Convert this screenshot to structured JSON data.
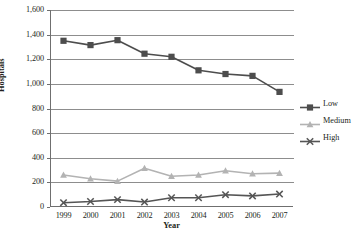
{
  "chart_data": {
    "type": "line",
    "title": "",
    "xlabel": "Year",
    "ylabel": "Hospitals",
    "categories": [
      "1999",
      "2000",
      "2001",
      "2002",
      "2003",
      "2004",
      "2005",
      "2006",
      "2007"
    ],
    "ylim": [
      0,
      1600
    ],
    "ytick_values": [
      0,
      200,
      400,
      600,
      800,
      1000,
      1200,
      1400,
      1600
    ],
    "ytick_labels": [
      "0",
      "200",
      "400",
      "600",
      "800",
      "1,000",
      "1,200",
      "1,400",
      "1,600"
    ],
    "grid": true,
    "legend_position": "right",
    "series": [
      {
        "name": "Low",
        "color": "#4d4d4d",
        "marker": "square",
        "values": [
          1350,
          1315,
          1355,
          1245,
          1220,
          1110,
          1080,
          1065,
          935
        ]
      },
      {
        "name": "Medium",
        "color": "#b3b3b3",
        "marker": "triangle",
        "values": [
          260,
          230,
          210,
          315,
          250,
          260,
          295,
          270,
          275
        ]
      },
      {
        "name": "High",
        "color": "#555555",
        "marker": "x",
        "values": [
          35,
          45,
          60,
          40,
          75,
          75,
          100,
          90,
          105
        ]
      }
    ]
  },
  "colors": {
    "axis": "#6f6f6f",
    "gridline": "#8d8d8d",
    "text": "#231f20",
    "background": "#ffffff",
    "low": "#4d4d4d",
    "medium": "#b3b3b3",
    "high": "#555555"
  }
}
